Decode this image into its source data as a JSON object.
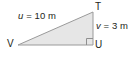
{
  "figure": {
    "type": "right-triangle-diagram",
    "shape": {
      "fill_color": "#e6e6e6",
      "stroke_color": "#9a9a9a",
      "vertices": [
        {
          "name": "V",
          "x": 18,
          "y": 45
        },
        {
          "name": "T",
          "x": 93,
          "y": 12
        },
        {
          "name": "U",
          "x": 93,
          "y": 45
        }
      ],
      "right_angle_at": "U"
    },
    "labels": {
      "hypotenuse": {
        "variable": "u",
        "equals": "= 10 m",
        "full": "u = 10 m"
      },
      "vertical_side": {
        "variable": "v",
        "equals": "= 3 m",
        "full": "v = 3 m"
      }
    },
    "vertices": {
      "left": "V",
      "top_right": "T",
      "bottom_right": "U"
    },
    "colors": {
      "text": "#231f20",
      "fill": "#e6e6e6",
      "stroke": "#9a9a9a",
      "background": "#ffffff"
    }
  }
}
